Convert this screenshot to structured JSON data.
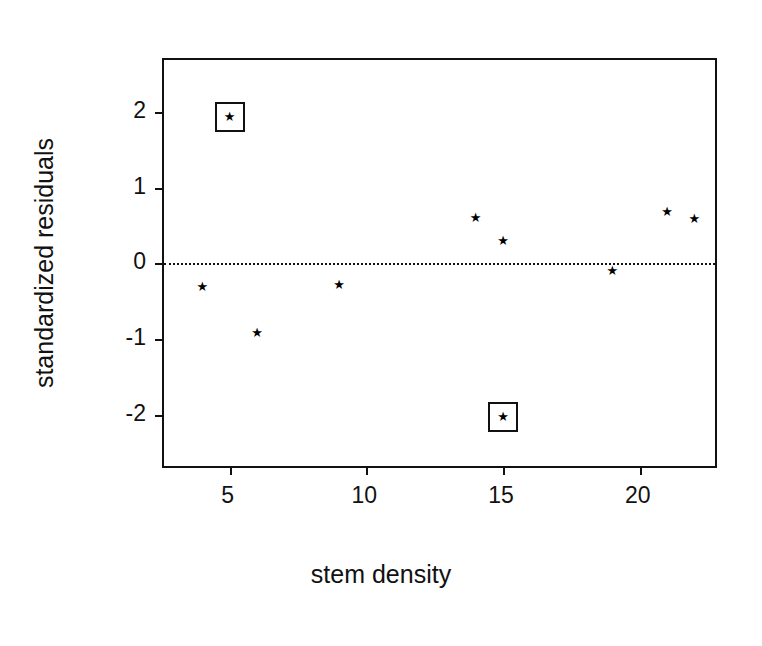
{
  "chart_data": {
    "type": "scatter",
    "title": "",
    "xlabel": "stem density",
    "ylabel": "standardized residuals",
    "xlim": [
      2.6,
      22.9
    ],
    "ylim": [
      -2.72,
      2.68
    ],
    "grid": false,
    "legend": null,
    "marker": "star",
    "reference_lines": [
      {
        "axis": "y",
        "value": 0,
        "style": "dotted"
      }
    ],
    "xticks": [
      5,
      10,
      15,
      20
    ],
    "xticklabels": [
      "5",
      "10",
      "15",
      "20"
    ],
    "yticks": [
      2,
      1,
      0,
      -1,
      -2
    ],
    "yticklabels": [
      "2",
      "1",
      "0",
      "-1",
      "-2"
    ],
    "x": [
      4,
      5,
      6,
      9,
      14,
      15,
      15,
      19,
      21,
      22
    ],
    "y": [
      -0.31,
      1.93,
      -0.91,
      -0.28,
      0.6,
      0.29,
      -2.02,
      -0.1,
      0.68,
      0.59
    ],
    "points": [
      {
        "x": 4,
        "y": -0.31,
        "highlighted": false
      },
      {
        "x": 5,
        "y": 1.93,
        "highlighted": true
      },
      {
        "x": 6,
        "y": -0.91,
        "highlighted": false
      },
      {
        "x": 9,
        "y": -0.28,
        "highlighted": false
      },
      {
        "x": 14,
        "y": 0.6,
        "highlighted": false
      },
      {
        "x": 15,
        "y": 0.29,
        "highlighted": false
      },
      {
        "x": 15,
        "y": -2.02,
        "highlighted": true
      },
      {
        "x": 19,
        "y": -0.1,
        "highlighted": false
      },
      {
        "x": 21,
        "y": 0.68,
        "highlighted": false
      },
      {
        "x": 22,
        "y": 0.59,
        "highlighted": false
      }
    ],
    "highlight_style": "square-outline-box",
    "colors": {
      "marker": "#000000",
      "axis": "#111111",
      "reference_line": "#111111",
      "background": "#ffffff"
    }
  }
}
